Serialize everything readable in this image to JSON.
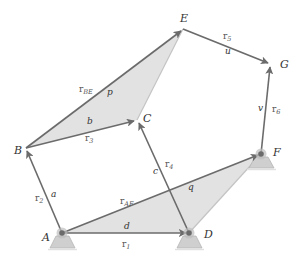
{
  "diagram": {
    "type": "linkage-kinematic-diagram",
    "colors": {
      "link": "#6b6b6b",
      "coupler_fill": "#e2e2e2",
      "coupler_edge": "#bdbdbd",
      "ground_fill": "#cfcfcf",
      "pin": "#7a7a7a",
      "text": "#333333"
    },
    "points": {
      "A": {
        "label": "A",
        "x": 62,
        "y": 233
      },
      "B": {
        "label": "B",
        "x": 26,
        "y": 148
      },
      "C": {
        "label": "C",
        "x": 137,
        "y": 120
      },
      "D": {
        "label": "D",
        "x": 189,
        "y": 233
      },
      "E": {
        "label": "E",
        "x": 183,
        "y": 29
      },
      "F": {
        "label": "F",
        "x": 261,
        "y": 154
      },
      "G": {
        "label": "G",
        "x": 271,
        "y": 64
      }
    },
    "vectors": {
      "r1": {
        "name": "r",
        "sub": "1",
        "length": "d",
        "from": "A",
        "to": "D"
      },
      "r2": {
        "name": "r",
        "sub": "2",
        "length": "a",
        "from": "A",
        "to": "B"
      },
      "r3": {
        "name": "r",
        "sub": "3",
        "length": "b",
        "from": "B",
        "to": "C"
      },
      "r4": {
        "name": "r",
        "sub": "4",
        "length": "c",
        "from": "D",
        "to": "C"
      },
      "r5": {
        "name": "r",
        "sub": "5",
        "length": "u",
        "from": "E",
        "to": "G"
      },
      "r6": {
        "name": "r",
        "sub": "6",
        "length": "v",
        "from": "F",
        "to": "G"
      },
      "rBE": {
        "name": "r",
        "sub": "BE",
        "length": "p",
        "from": "B",
        "to": "E"
      },
      "rAF": {
        "name": "r",
        "sub": "AF",
        "length": "q",
        "from": "A",
        "to": "F"
      }
    },
    "ground_pivots": [
      "A",
      "D",
      "F"
    ]
  }
}
